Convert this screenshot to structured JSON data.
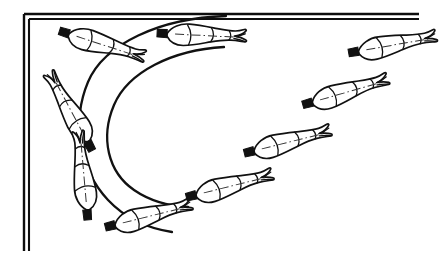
{
  "figure": {
    "type": "technical-line-diagram",
    "canvas": {
      "width": 448,
      "height": 261,
      "background": "#ffffff"
    },
    "stroke_color": "#111111",
    "fill_color": "#ffffff"
  },
  "frame": {
    "name": "partial double-line border",
    "style": "double",
    "segments": [
      {
        "id": "top-outer",
        "x1": 24,
        "y1": 14,
        "x2": 419,
        "y2": 14
      },
      {
        "id": "top-inner",
        "x1": 29,
        "y1": 19,
        "x2": 419,
        "y2": 19
      },
      {
        "id": "left-outer",
        "x1": 24,
        "y1": 14,
        "x2": 24,
        "y2": 251
      },
      {
        "id": "left-inner",
        "x1": 29,
        "y1": 19,
        "x2": 29,
        "y2": 251
      }
    ],
    "stroke_width": 2.2
  },
  "trajectories": [
    {
      "id": "arc-outer",
      "label": "outer flight path",
      "path": "M 226,16 C 160,18 104,44 88,82 C 72,120 78,168 108,200 C 124,217 146,228 172,232",
      "stroke_width": 2.3
    },
    {
      "id": "arc-inner",
      "label": "inner flight path",
      "path": "M 224,47 C 172,50 128,72 114,105 C 100,138 108,172 134,190 C 150,201 168,206 188,207",
      "stroke_width": 2.3
    }
  ],
  "bodies": [
    {
      "index": 1,
      "name": "body-position-1",
      "phase": "descending, head down-left",
      "x": 70,
      "y": 108,
      "rotation": -118,
      "length": 78,
      "scale": 1.0
    },
    {
      "index": 2,
      "name": "body-position-2",
      "phase": "bottom of arc, vertical",
      "x": 84,
      "y": 172,
      "rotation": -95,
      "length": 80,
      "scale": 1.0
    },
    {
      "index": 3,
      "name": "body-position-3",
      "phase": "rising, nearly horizontal",
      "x": 152,
      "y": 216,
      "rotation": -14,
      "length": 82,
      "scale": 1.0
    },
    {
      "index": 4,
      "name": "body-position-4",
      "phase": "rising right, head left",
      "x": 233,
      "y": 186,
      "rotation": -14,
      "length": 84,
      "scale": 1.0
    },
    {
      "index": 5,
      "name": "body-position-5",
      "phase": "rising right",
      "x": 291,
      "y": 142,
      "rotation": -14,
      "length": 84,
      "scale": 1.0
    },
    {
      "index": 6,
      "name": "body-position-6",
      "phase": "rising right, upper",
      "x": 349,
      "y": 92,
      "rotation": -16,
      "length": 84,
      "scale": 1.0
    },
    {
      "index": 7,
      "name": "body-position-7",
      "phase": "top right, near-horizontal",
      "x": 396,
      "y": 45,
      "rotation": -10,
      "length": 80,
      "scale": 1.0
    },
    {
      "index": 8,
      "name": "body-position-8",
      "phase": "apex of arc, horizontal",
      "x": 205,
      "y": 36,
      "rotation": 3,
      "length": 86,
      "scale": 1.0
    },
    {
      "index": 9,
      "name": "body-position-9",
      "phase": "approaching apex, head right",
      "x": 105,
      "y": 46,
      "rotation": 18,
      "length": 82,
      "scale": 1.0
    }
  ]
}
